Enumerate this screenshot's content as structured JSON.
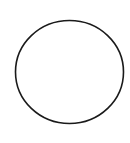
{
  "canvas": {
    "width": 130,
    "height": 143,
    "background": "#ffffff"
  },
  "shape": {
    "type": "circle-outline",
    "cx": 69.5,
    "cy": 72,
    "rx": 54,
    "ry": 51.5,
    "stroke": "#1a1a1a",
    "stroke_width": 1.6,
    "fill": "none"
  }
}
